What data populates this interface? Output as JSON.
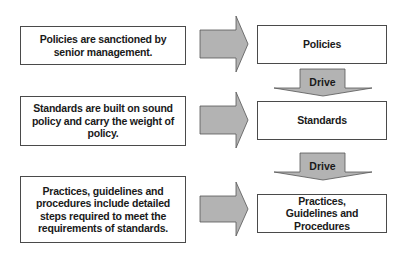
{
  "diagram": {
    "descriptions": [
      {
        "text": "Policies are sanctioned by senior management."
      },
      {
        "text": "Standards are built on sound policy and carry the weight of policy."
      },
      {
        "text": "Practices, guidelines and procedures include detailed steps required to meet the requirements of standards."
      }
    ],
    "levels": [
      {
        "label": "Policies"
      },
      {
        "label": "Standards"
      },
      {
        "label": "Practices, Guidelines and Procedures"
      }
    ],
    "connectors": [
      {
        "label": "Drive",
        "from": "Policies",
        "to": "Standards"
      },
      {
        "label": "Drive",
        "from": "Standards",
        "to": "Practices, Guidelines and Procedures"
      }
    ],
    "colors": {
      "arrow_fill": "#b3b3b3",
      "arrow_stroke": "#555555",
      "box_border": "#4a4a4a"
    }
  }
}
